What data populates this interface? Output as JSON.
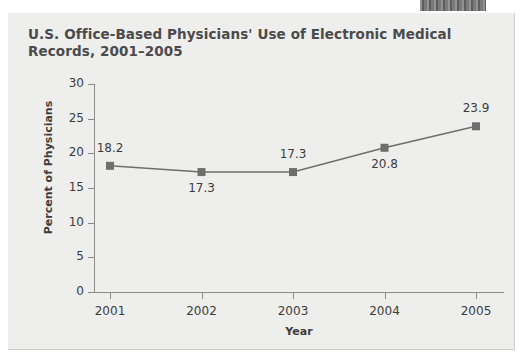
{
  "top_band": {
    "name": "cropped-header-band",
    "color": "#6e6e6e",
    "text": ""
  },
  "panel": {
    "background": "#eeeeec"
  },
  "chart_data": {
    "type": "line",
    "title": "U.S. Office-Based Physicians' Use of Electronic Medical\nRecords, 2001–2005",
    "xlabel": "Year",
    "ylabel": "Percent of Physicians",
    "categories": [
      "2001",
      "2002",
      "2003",
      "2004",
      "2005"
    ],
    "values": [
      18.2,
      17.3,
      17.3,
      20.8,
      23.9
    ],
    "point_labels": [
      "18.2",
      "17.3",
      "17.3",
      "20.8",
      "23.9"
    ],
    "label_positions": [
      "above",
      "below",
      "above",
      "below",
      "above"
    ],
    "ylim": [
      0,
      30
    ],
    "yticks": [
      0,
      5,
      10,
      15,
      20,
      25,
      30
    ],
    "ytick_labels": [
      "0",
      "5",
      "10",
      "15",
      "20",
      "25",
      "30"
    ],
    "grid": false,
    "legend": "none",
    "series_color": "#6e6e6e",
    "marker": "square",
    "axis_color": "#8b8b8b"
  }
}
